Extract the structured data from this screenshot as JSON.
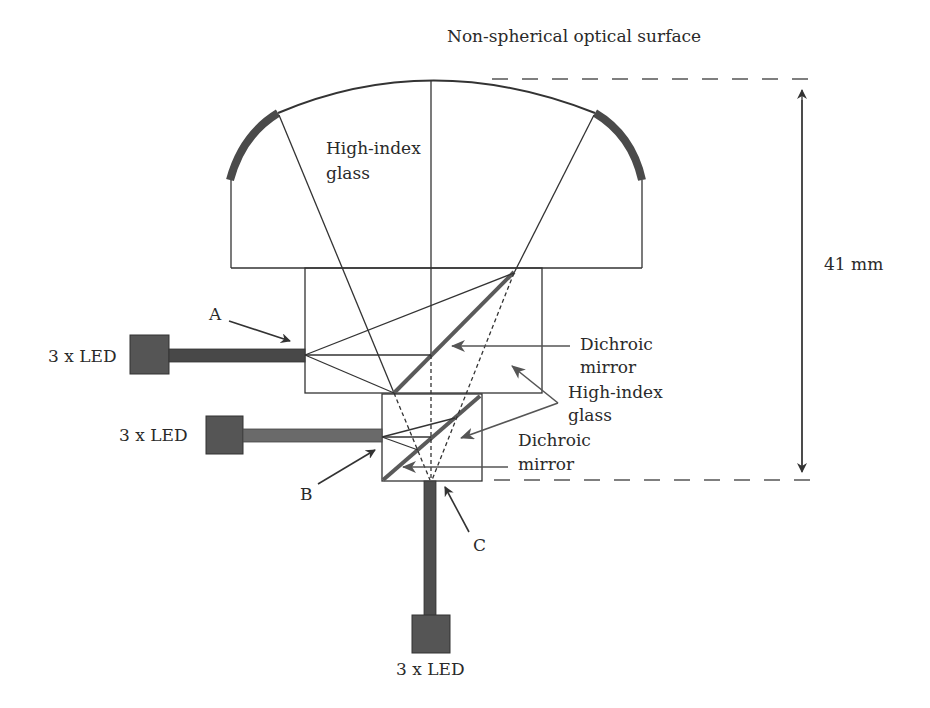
{
  "figure": {
    "title_label": "Non-spherical optical surface",
    "dimension": {
      "label": "41 mm",
      "value": 41,
      "unit": "mm"
    },
    "glass_top_label": {
      "line1": "High-index",
      "line2": "glass"
    },
    "glass_side_label": {
      "line1": "High-index",
      "line2": "glass"
    },
    "mirror_upper_label": {
      "line1": "Dichroic",
      "line2": "mirror"
    },
    "mirror_lower_label": {
      "line1": "Dichroic",
      "line2": "mirror"
    },
    "ports": [
      {
        "id": "A",
        "label": "A"
      },
      {
        "id": "B",
        "label": "B"
      },
      {
        "id": "C",
        "label": "C"
      }
    ],
    "leds": [
      {
        "id": "led-a",
        "label": "3 x LED"
      },
      {
        "id": "led-b",
        "label": "3 x LED"
      },
      {
        "id": "led-c",
        "label": "3 x LED"
      }
    ]
  },
  "colors": {
    "line": "#333333",
    "mirror": "#5a5a5a",
    "led_fill": "#555555",
    "fiber_a": "#484848",
    "fiber_b": "#6a6a6a",
    "fiber_c": "#4e4e4e",
    "background": "#ffffff"
  }
}
